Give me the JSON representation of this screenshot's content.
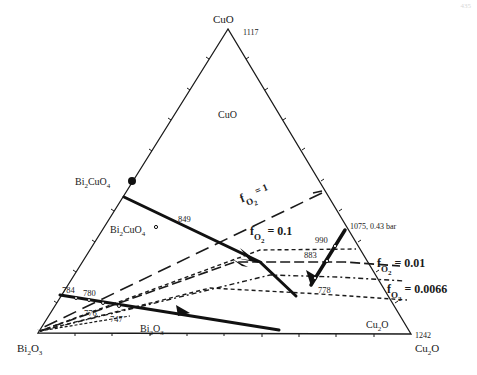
{
  "page_number": "435",
  "diagram": {
    "type": "ternary phase diagram",
    "vertices": {
      "top": {
        "label": "CuO",
        "temp": "1117"
      },
      "bottom_left": {
        "label_main": "Bi",
        "label_sub1": "2",
        "label_mid": "O",
        "label_sub2": "3"
      },
      "bottom_right": {
        "label_main": "Cu",
        "label_sub1": "2",
        "label_mid": "O",
        "temp": "1242"
      }
    },
    "phase_labels": {
      "cuo_field": "CuO",
      "bi2cuo4_point": {
        "a": "Bi",
        "s1": "2",
        "b": "CuO",
        "s2": "4"
      },
      "bi2cuo4_field": {
        "a": "Bi",
        "s1": "2",
        "b": "CuO",
        "s2": "4"
      },
      "bi2o3_field": {
        "a": "Bi",
        "s1": "2",
        "b": "O",
        "s2": "3"
      },
      "cu2o_field": {
        "a": "Cu",
        "s1": "2",
        "b": "O"
      }
    },
    "temperatures": {
      "t849": "849",
      "t990": "990",
      "t883": "883",
      "t778": "778",
      "t784": "784",
      "t780": "780",
      "t776": "776",
      "t747": "747",
      "t1075": "1075, 0.43 bar"
    },
    "isobars": [
      {
        "f": "f",
        "sub": "O",
        "sub2": "2",
        "value": "= 1"
      },
      {
        "f": "f",
        "sub": "O",
        "sub2": "2",
        "value": "= 0.1"
      },
      {
        "f": "f",
        "sub": "O",
        "sub2": "2",
        "value": "= 0.01"
      },
      {
        "f": "f",
        "sub": "O",
        "sub2": "2",
        "value": "= 0.0066"
      }
    ]
  }
}
